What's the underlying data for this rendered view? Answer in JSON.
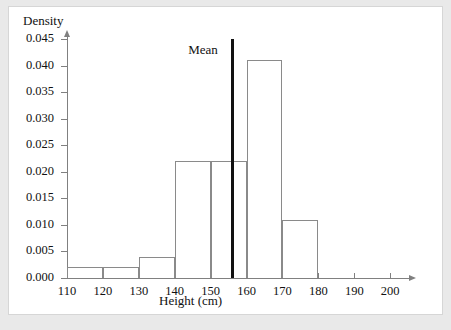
{
  "chart_data": {
    "type": "bar",
    "title": "",
    "xlabel": "Height (cm)",
    "ylabel": "Density",
    "xlim": [
      110,
      203
    ],
    "ylim": [
      0.0,
      0.045
    ],
    "grid": false,
    "legend": "none",
    "bin_edges": [
      110,
      120,
      130,
      140,
      150,
      160,
      170,
      180
    ],
    "categories": [
      "110-120",
      "120-130",
      "130-140",
      "140-150",
      "150-160",
      "160-170",
      "170-180"
    ],
    "values": [
      0.002,
      0.002,
      0.004,
      0.022,
      0.022,
      0.041,
      0.011
    ],
    "xticks": [
      "110",
      "120",
      "130",
      "140",
      "150",
      "160",
      "170",
      "180",
      "190",
      "200"
    ],
    "xtick_values": [
      110,
      120,
      130,
      140,
      150,
      160,
      170,
      180,
      190,
      200
    ],
    "yticks": [
      "0.000",
      "0.005",
      "0.010",
      "0.015",
      "0.020",
      "0.025",
      "0.030",
      "0.035",
      "0.040",
      "0.045"
    ],
    "ytick_values": [
      0.0,
      0.005,
      0.01,
      0.015,
      0.02,
      0.025,
      0.03,
      0.035,
      0.04,
      0.045
    ],
    "annotations": [
      {
        "name": "mean",
        "label": "Mean",
        "x_value": 156,
        "y_top": 0.045
      }
    ],
    "colors": {
      "bar_outline": "#8a8a8a",
      "axis": "#808080",
      "mean_line": "#111111",
      "text": "#111111",
      "plot_background": "#ffffff",
      "page_background": "#e9e9e9"
    }
  }
}
